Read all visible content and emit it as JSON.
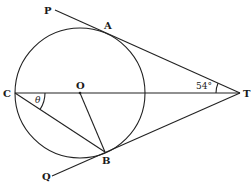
{
  "figure": {
    "type": "geometry",
    "points": {
      "P": {
        "label": "P",
        "x": 55,
        "y": 10
      },
      "A": {
        "label": "A",
        "x": 107,
        "y": 32
      },
      "C": {
        "label": "C",
        "x": 15,
        "y": 93
      },
      "O": {
        "label": "O",
        "x": 80,
        "y": 93
      },
      "T": {
        "label": "T",
        "x": 240,
        "y": 93
      },
      "B": {
        "label": "B",
        "x": 105,
        "y": 152
      },
      "Q": {
        "label": "Q",
        "x": 52,
        "y": 176
      }
    },
    "circle": {
      "center": "O",
      "cx": 80,
      "cy": 93,
      "r": 65
    },
    "angles": {
      "ATC": {
        "label": "54°",
        "vertex": "T"
      },
      "OCB": {
        "label": "θ",
        "vertex": "C"
      }
    },
    "colors": {
      "stroke": "#222222",
      "background": "#ffffff"
    }
  }
}
